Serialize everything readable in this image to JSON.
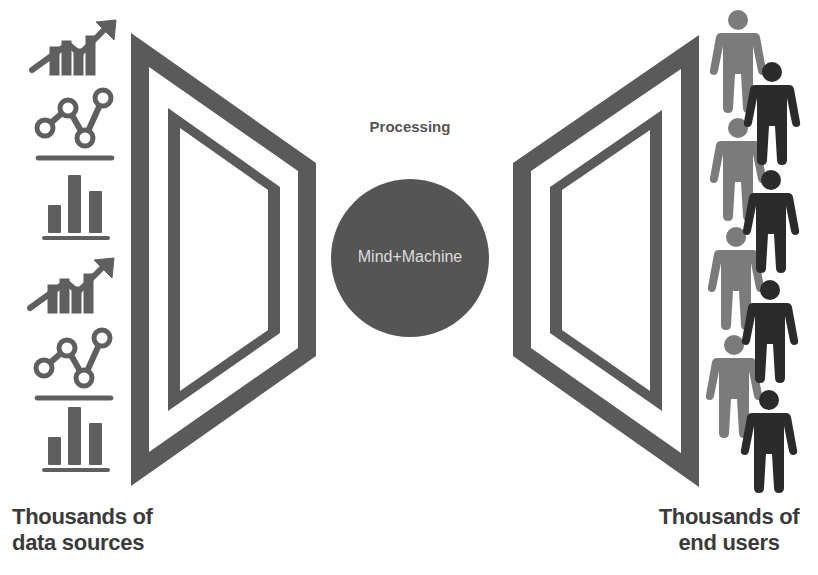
{
  "diagram": {
    "type": "process-flow",
    "colors": {
      "background": "#ffffff",
      "frame": "#5a5a5a",
      "circle": "#555555",
      "circle_text": "#dcdcdc",
      "icon": "#5f5f5f",
      "person_light": "#7b7b7b",
      "person_dark": "#2b2b2b",
      "label": "#3a3a3a"
    },
    "left": {
      "label_line1": "Thousands of",
      "label_line2": "data sources",
      "icons": [
        "trend-up-chart-icon",
        "line-nodes-chart-icon",
        "bar-chart-icon",
        "trend-up-chart-icon",
        "line-nodes-chart-icon",
        "bar-chart-icon"
      ]
    },
    "center": {
      "heading": "Processing",
      "circle_label": "Mind+Machine"
    },
    "right": {
      "label_line1": "Thousands of",
      "label_line2": "end users",
      "people": {
        "light_count": 4,
        "dark_count": 4,
        "icon": "person-icon"
      }
    }
  }
}
